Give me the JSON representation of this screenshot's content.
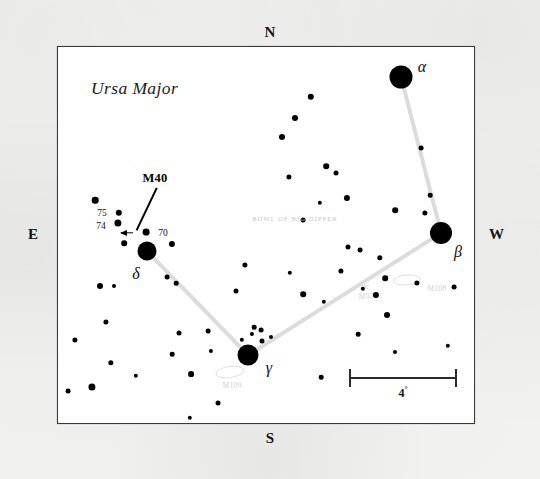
{
  "chart_data": {
    "type": "scatter",
    "title": "Ursa Major",
    "subtitle": "BOWL OF BIG DIPPER",
    "xlabel": "",
    "ylabel": "",
    "projection": "sky chart, north up, east left",
    "scale_bar": {
      "length_label": "4",
      "unit": "°",
      "length_px": 108
    },
    "compass": {
      "north": "N",
      "south": "S",
      "east": "E",
      "west": "W"
    },
    "frame": {
      "x": 57,
      "y": 46,
      "width": 416,
      "height": 376
    },
    "named_stars": [
      {
        "name": "α",
        "label": "α",
        "x": 343,
        "y": 30,
        "r": 11.5,
        "label_x": 364,
        "label_y": 20
      },
      {
        "name": "β",
        "label": "β",
        "x": 383,
        "y": 186,
        "r": 11.0,
        "label_x": 400,
        "label_y": 205
      },
      {
        "name": "γ",
        "label": "γ",
        "x": 190,
        "y": 308,
        "r": 10.5,
        "label_x": 211,
        "label_y": 321
      },
      {
        "name": "δ",
        "label": "δ",
        "x": 89,
        "y": 204,
        "r": 9.5,
        "label_x": 78,
        "label_y": 227
      },
      {
        "name": "70",
        "label": "70",
        "x": 88,
        "y": 185,
        "r": 3.4,
        "label_x": 105,
        "label_y": 186
      },
      {
        "name": "75",
        "label": "75",
        "x": 61,
        "y": 166,
        "r": 3.2,
        "label_x": 44,
        "label_y": 166
      },
      {
        "name": "74",
        "label": "74",
        "x": 60,
        "y": 176,
        "r": 3.6,
        "label_x": 43,
        "label_y": 179
      }
    ],
    "field_stars": [
      {
        "x": 37,
        "y": 153,
        "r": 3.3
      },
      {
        "x": 66,
        "y": 196,
        "r": 2.8
      },
      {
        "x": 114,
        "y": 197,
        "r": 3.1
      },
      {
        "x": 42,
        "y": 239,
        "r": 3.0
      },
      {
        "x": 48,
        "y": 275,
        "r": 2.6
      },
      {
        "x": 56,
        "y": 239,
        "r": 2.0
      },
      {
        "x": 109,
        "y": 230,
        "r": 2.4
      },
      {
        "x": 53,
        "y": 316,
        "r": 2.7
      },
      {
        "x": 118,
        "y": 236,
        "r": 2.3
      },
      {
        "x": 78,
        "y": 329,
        "r": 2.2
      },
      {
        "x": 17,
        "y": 293,
        "r": 2.6
      },
      {
        "x": 10,
        "y": 344,
        "r": 2.4
      },
      {
        "x": 34,
        "y": 340,
        "r": 3.6
      },
      {
        "x": 114,
        "y": 307,
        "r": 2.3
      },
      {
        "x": 121,
        "y": 286,
        "r": 2.5
      },
      {
        "x": 150,
        "y": 284,
        "r": 2.4
      },
      {
        "x": 133,
        "y": 327,
        "r": 2.9
      },
      {
        "x": 153,
        "y": 304,
        "r": 2.1
      },
      {
        "x": 178,
        "y": 244,
        "r": 2.5
      },
      {
        "x": 187,
        "y": 218,
        "r": 2.6
      },
      {
        "x": 232,
        "y": 226,
        "r": 2.2
      },
      {
        "x": 245,
        "y": 247,
        "r": 2.8
      },
      {
        "x": 266,
        "y": 255,
        "r": 2.2
      },
      {
        "x": 283,
        "y": 224,
        "r": 2.6
      },
      {
        "x": 290,
        "y": 200,
        "r": 2.5
      },
      {
        "x": 302,
        "y": 203,
        "r": 2.4
      },
      {
        "x": 322,
        "y": 211,
        "r": 2.7
      },
      {
        "x": 213,
        "y": 290,
        "r": 2.0
      },
      {
        "x": 204,
        "y": 294,
        "r": 2.5
      },
      {
        "x": 196,
        "y": 280,
        "r": 2.3
      },
      {
        "x": 160,
        "y": 356,
        "r": 2.5
      },
      {
        "x": 132,
        "y": 371,
        "r": 2.2
      },
      {
        "x": 194,
        "y": 287,
        "r": 2.1
      },
      {
        "x": 253,
        "y": 50,
        "r": 3.2
      },
      {
        "x": 237,
        "y": 71,
        "r": 3.0
      },
      {
        "x": 224,
        "y": 90,
        "r": 3.0
      },
      {
        "x": 231,
        "y": 130,
        "r": 2.6
      },
      {
        "x": 268,
        "y": 119,
        "r": 2.8
      },
      {
        "x": 278,
        "y": 126,
        "r": 2.5
      },
      {
        "x": 245,
        "y": 173,
        "r": 2.4
      },
      {
        "x": 289,
        "y": 151,
        "r": 3.1
      },
      {
        "x": 337,
        "y": 163,
        "r": 2.8
      },
      {
        "x": 367,
        "y": 166,
        "r": 2.6
      },
      {
        "x": 327,
        "y": 231,
        "r": 2.8
      },
      {
        "x": 318,
        "y": 248,
        "r": 3.1
      },
      {
        "x": 329,
        "y": 268,
        "r": 3.0
      },
      {
        "x": 305,
        "y": 242,
        "r": 2.2
      },
      {
        "x": 359,
        "y": 236,
        "r": 2.6
      },
      {
        "x": 372,
        "y": 148,
        "r": 2.3
      },
      {
        "x": 300,
        "y": 287,
        "r": 2.3
      },
      {
        "x": 396,
        "y": 240,
        "r": 2.4
      },
      {
        "x": 390,
        "y": 299,
        "r": 2.2
      },
      {
        "x": 263,
        "y": 330,
        "r": 2.3
      },
      {
        "x": 337,
        "y": 305,
        "r": 2.0
      },
      {
        "x": 203,
        "y": 283,
        "r": 2.4
      },
      {
        "x": 363,
        "y": 101,
        "r": 2.4
      },
      {
        "x": 262,
        "y": 156,
        "r": 2.2
      },
      {
        "x": 184,
        "y": 293,
        "r": 2.2
      }
    ],
    "dipper_segments": [
      {
        "from": "α",
        "to": "β",
        "x1": 343,
        "y1": 30,
        "x2": 383,
        "y2": 186
      },
      {
        "from": "β",
        "to": "γ",
        "x1": 383,
        "y1": 186,
        "x2": 190,
        "y2": 308
      },
      {
        "from": "γ",
        "to": "δ",
        "x1": 190,
        "y1": 308,
        "x2": 89,
        "y2": 204
      }
    ],
    "callout": {
      "label": "M40",
      "label_x": 97,
      "label_y": 131,
      "leader_x1": 99,
      "leader_y1": 141,
      "leader_x2": 79,
      "leader_y2": 183,
      "arrow_x": 63,
      "arrow_y": 186,
      "arrow_len": 12
    },
    "deep_sky_objects": [
      {
        "label": "M97",
        "label_x": 308,
        "label_y": 249,
        "marker_x": 306,
        "marker_y": 240,
        "marker": "✻",
        "ellipse_w": 0,
        "ellipse_h": 0
      },
      {
        "label": "M108",
        "label_x": 379,
        "label_y": 241,
        "ellipse_x": 349,
        "ellipse_y": 233,
        "ellipse_w": 26,
        "ellipse_h": 9,
        "ellipse_rot": -4
      },
      {
        "label": "M109",
        "label_x": 174,
        "label_y": 338,
        "ellipse_x": 172,
        "ellipse_y": 325,
        "ellipse_w": 27,
        "ellipse_h": 10,
        "ellipse_rot": -8
      }
    ],
    "annotations": [
      {
        "text": "BOWL OF BIG DIPPER",
        "x": 237,
        "y": 171
      }
    ],
    "colors": {
      "star": "#000000",
      "line": "#dcdcdc",
      "frame": "#3a3a3a",
      "faint": "#d2d2d2",
      "paper": "#f0f0ee"
    }
  }
}
